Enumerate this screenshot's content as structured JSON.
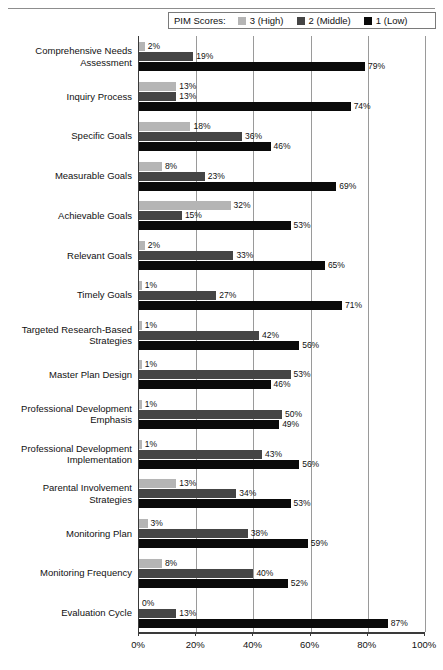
{
  "legend": {
    "title": "PIM Scores:",
    "items": [
      {
        "label": "3 (High)",
        "color": "#b5b5b5"
      },
      {
        "label": "2 (Middle)",
        "color": "#454545"
      },
      {
        "label": "1 (Low)",
        "color": "#0a0a0a"
      }
    ]
  },
  "axis": {
    "ticks": [
      "0%",
      "20%",
      "40%",
      "60%",
      "80%",
      "100%"
    ],
    "tick_values": [
      0,
      20,
      40,
      60,
      80,
      100
    ]
  },
  "chart_data": {
    "type": "bar",
    "orientation": "horizontal",
    "title": "",
    "subtitle": "",
    "xlabel": "",
    "ylabel": "",
    "xlim": [
      0,
      100
    ],
    "grid": true,
    "legend_position": "top",
    "legend_title": "PIM Scores:",
    "value_suffix": "%",
    "categories": [
      "Comprehensive Needs Assessment",
      "Inquiry Process",
      "Specific Goals",
      "Measurable Goals",
      "Achievable Goals",
      "Relevant Goals",
      "Timely Goals",
      "Targeted Research-Based Strategies",
      "Master Plan Design",
      "Professional Development Emphasis",
      "Professional Development Implementation",
      "Parental Involvement Strategies",
      "Monitoring Plan",
      "Monitoring Frequency",
      "Evaluation Cycle"
    ],
    "series": [
      {
        "name": "3 (High)",
        "color": "#b5b5b5",
        "values": [
          2,
          13,
          18,
          8,
          32,
          2,
          1,
          1,
          1,
          1,
          1,
          13,
          3,
          8,
          0
        ],
        "labels": [
          "2%",
          "13%",
          "18%",
          "8%",
          "32%",
          "2%",
          "1%",
          "1%",
          "1%",
          "1%",
          "1%",
          "13%",
          "3%",
          "8%",
          "0%"
        ]
      },
      {
        "name": "2 (Middle)",
        "color": "#454545",
        "values": [
          19,
          13,
          36,
          23,
          15,
          33,
          27,
          42,
          53,
          50,
          43,
          34,
          38,
          40,
          13
        ],
        "labels": [
          "19%",
          "13%",
          "36%",
          "23%",
          "15%",
          "33%",
          "27%",
          "42%",
          "53%",
          "50%",
          "43%",
          "34%",
          "38%",
          "40%",
          "13%"
        ]
      },
      {
        "name": "1 (Low)",
        "color": "#0a0a0a",
        "values": [
          79,
          74,
          46,
          69,
          53,
          65,
          71,
          56,
          46,
          49,
          56,
          53,
          59,
          52,
          87
        ],
        "labels": [
          "79%",
          "74%",
          "46%",
          "69%",
          "53%",
          "65%",
          "71%",
          "56%",
          "46%",
          "49%",
          "56%",
          "53%",
          "59%",
          "52%",
          "87%"
        ]
      }
    ]
  }
}
